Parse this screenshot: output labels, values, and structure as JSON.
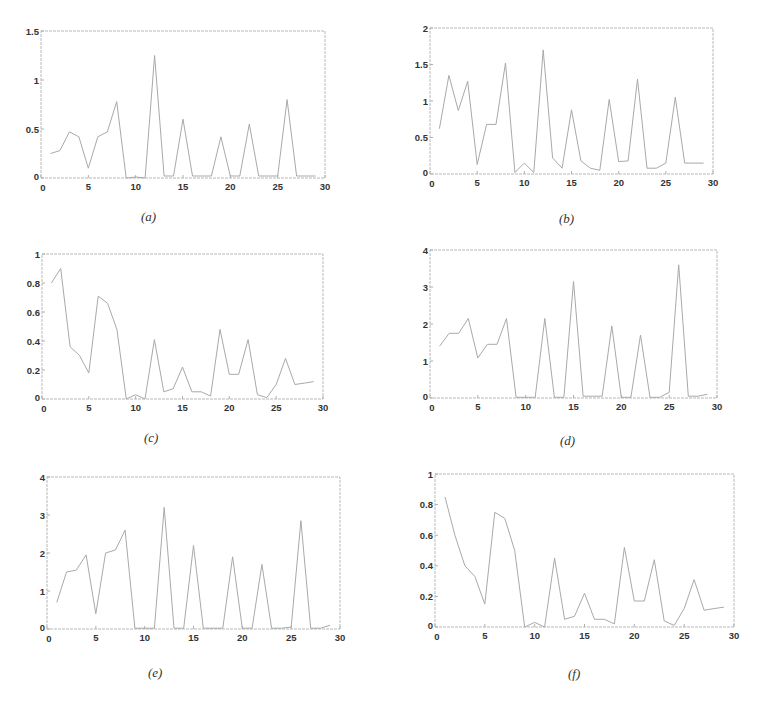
{
  "chart_data": [
    {
      "type": "line",
      "caption": "(a)",
      "x": [
        1,
        2,
        3,
        4,
        5,
        6,
        7,
        8,
        9,
        10,
        11,
        12,
        13,
        14,
        15,
        16,
        17,
        18,
        19,
        20,
        21,
        22,
        23,
        24,
        25,
        26,
        27,
        28,
        29
      ],
      "values": [
        0.25,
        0.28,
        0.47,
        0.42,
        0.1,
        0.42,
        0.47,
        0.78,
        0.0,
        0.01,
        0.0,
        1.25,
        0.02,
        0.02,
        0.6,
        0.02,
        0.02,
        0.02,
        0.42,
        0.02,
        0.02,
        0.55,
        0.02,
        0.02,
        0.02,
        0.8,
        0.02,
        0.02,
        0.02
      ],
      "xlim": [
        0,
        30
      ],
      "ylim": [
        0,
        1.5
      ],
      "xticks": [
        0,
        5,
        10,
        15,
        20,
        25,
        30
      ],
      "yticks": [
        0,
        0.5,
        1,
        1.5
      ],
      "xtick_labels": [
        "0",
        "5",
        "10",
        "15",
        "20",
        "25",
        "30"
      ],
      "ytick_labels": [
        "0",
        "0.5",
        "1",
        "1.5"
      ],
      "title": "",
      "xlabel": "",
      "ylabel": "",
      "grid": false,
      "box": {
        "left": 41,
        "top": 31,
        "right": 325,
        "bottom": 178
      },
      "caption_pos": {
        "left": 141,
        "top": 219
      }
    },
    {
      "type": "line",
      "caption": "(b)",
      "x": [
        1,
        2,
        3,
        4,
        5,
        6,
        7,
        8,
        9,
        10,
        11,
        12,
        13,
        14,
        15,
        16,
        17,
        18,
        19,
        20,
        21,
        22,
        23,
        24,
        25,
        26,
        27,
        28,
        29
      ],
      "values": [
        0.62,
        1.35,
        0.87,
        1.27,
        0.13,
        0.68,
        0.68,
        1.52,
        0.02,
        0.15,
        0.02,
        1.7,
        0.22,
        0.08,
        0.88,
        0.18,
        0.08,
        0.05,
        1.02,
        0.17,
        0.18,
        1.3,
        0.08,
        0.08,
        0.15,
        1.05,
        0.15,
        0.15,
        0.15
      ],
      "xlim": [
        0,
        30
      ],
      "ylim": [
        0,
        2
      ],
      "xticks": [
        0,
        5,
        10,
        15,
        20,
        25,
        30
      ],
      "yticks": [
        0,
        0.5,
        1,
        1.5,
        2
      ],
      "xtick_labels": [
        "0",
        "5",
        "10",
        "15",
        "20",
        "25",
        "30"
      ],
      "ytick_labels": [
        "0",
        "0.5",
        "1",
        "1.5",
        "2"
      ],
      "title": "",
      "xlabel": "",
      "ylabel": "",
      "grid": false,
      "box": {
        "left": 430,
        "top": 28,
        "right": 713,
        "bottom": 174
      },
      "caption_pos": {
        "left": 559,
        "top": 221
      }
    },
    {
      "type": "line",
      "caption": "(c)",
      "x": [
        1,
        2,
        3,
        4,
        5,
        6,
        7,
        8,
        9,
        10,
        11,
        12,
        13,
        14,
        15,
        16,
        17,
        18,
        19,
        20,
        21,
        22,
        23,
        24,
        25,
        26,
        27,
        28,
        29
      ],
      "values": [
        0.8,
        0.9,
        0.36,
        0.3,
        0.18,
        0.71,
        0.66,
        0.48,
        0.0,
        0.03,
        0.0,
        0.41,
        0.05,
        0.07,
        0.22,
        0.05,
        0.05,
        0.02,
        0.48,
        0.17,
        0.17,
        0.41,
        0.03,
        0.01,
        0.1,
        0.28,
        0.1,
        0.11,
        0.12
      ],
      "xlim": [
        0,
        30
      ],
      "ylim": [
        0,
        1
      ],
      "xticks": [
        0,
        5,
        10,
        15,
        20,
        25,
        30
      ],
      "yticks": [
        0,
        0.2,
        0.4,
        0.6,
        0.8,
        1
      ],
      "xtick_labels": [
        "0",
        "5",
        "10",
        "15",
        "20",
        "25",
        "30"
      ],
      "ytick_labels": [
        "0",
        "0.2",
        "0.4",
        "0.6",
        "0.8",
        "1"
      ],
      "title": "",
      "xlabel": "",
      "ylabel": "",
      "grid": false,
      "box": {
        "left": 42,
        "top": 254,
        "right": 323,
        "bottom": 399
      },
      "caption_pos": {
        "left": 144,
        "top": 440
      }
    },
    {
      "type": "line",
      "caption": "(d)",
      "x": [
        1,
        2,
        3,
        4,
        5,
        6,
        7,
        8,
        9,
        10,
        11,
        12,
        13,
        14,
        15,
        16,
        17,
        18,
        19,
        20,
        21,
        22,
        23,
        24,
        25,
        26,
        27,
        28,
        29
      ],
      "values": [
        1.4,
        1.75,
        1.75,
        2.15,
        1.08,
        1.45,
        1.45,
        2.15,
        0.02,
        0.02,
        0.02,
        2.15,
        0.02,
        0.02,
        3.15,
        0.05,
        0.05,
        0.05,
        1.95,
        0.02,
        0.02,
        1.7,
        0.02,
        0.02,
        0.15,
        3.6,
        0.05,
        0.05,
        0.1
      ],
      "xlim": [
        0,
        30
      ],
      "ylim": [
        0,
        4
      ],
      "xticks": [
        0,
        5,
        10,
        15,
        20,
        25,
        30
      ],
      "yticks": [
        0,
        1,
        2,
        3,
        4
      ],
      "xtick_labels": [
        "0",
        "5",
        "10",
        "15",
        "20",
        "25",
        "30"
      ],
      "ytick_labels": [
        "0",
        "1",
        "2",
        "3",
        "4"
      ],
      "title": "",
      "xlabel": "",
      "ylabel": "",
      "grid": false,
      "box": {
        "left": 430,
        "top": 250,
        "right": 717,
        "bottom": 398
      },
      "caption_pos": {
        "left": 560,
        "top": 443
      }
    },
    {
      "type": "line",
      "caption": "(e)",
      "x": [
        1,
        2,
        3,
        4,
        5,
        6,
        7,
        8,
        9,
        10,
        11,
        12,
        13,
        14,
        15,
        16,
        17,
        18,
        19,
        20,
        21,
        22,
        23,
        24,
        25,
        26,
        27,
        28,
        29
      ],
      "values": [
        0.7,
        1.5,
        1.55,
        1.95,
        0.4,
        2.0,
        2.08,
        2.6,
        0.02,
        0.02,
        0.02,
        3.2,
        0.02,
        0.02,
        2.2,
        0.02,
        0.02,
        0.02,
        1.9,
        0.02,
        0.02,
        1.7,
        0.02,
        0.02,
        0.05,
        2.85,
        0.02,
        0.02,
        0.1
      ],
      "xlim": [
        0,
        30
      ],
      "ylim": [
        0,
        4
      ],
      "xticks": [
        0,
        5,
        10,
        15,
        20,
        25,
        30
      ],
      "yticks": [
        0,
        1,
        2,
        3,
        4
      ],
      "xtick_labels": [
        "0",
        "5",
        "10",
        "15",
        "20",
        "25",
        "30"
      ],
      "ytick_labels": [
        "0",
        "1",
        "2",
        "3",
        "4"
      ],
      "title": "",
      "xlabel": "",
      "ylabel": "",
      "grid": false,
      "box": {
        "left": 47,
        "top": 477,
        "right": 340,
        "bottom": 629
      },
      "caption_pos": {
        "left": 148,
        "top": 675
      }
    },
    {
      "type": "line",
      "caption": "(f)",
      "x": [
        1,
        2,
        3,
        4,
        5,
        6,
        7,
        8,
        9,
        10,
        11,
        12,
        13,
        14,
        15,
        16,
        17,
        18,
        19,
        20,
        21,
        22,
        23,
        24,
        25,
        26,
        27,
        28,
        29
      ],
      "values": [
        0.85,
        0.6,
        0.4,
        0.33,
        0.15,
        0.75,
        0.71,
        0.5,
        0.0,
        0.03,
        0.0,
        0.45,
        0.05,
        0.07,
        0.22,
        0.05,
        0.05,
        0.02,
        0.52,
        0.17,
        0.17,
        0.44,
        0.04,
        0.01,
        0.12,
        0.31,
        0.11,
        0.12,
        0.13
      ],
      "xlim": [
        0,
        30
      ],
      "ylim": [
        0,
        1
      ],
      "xticks": [
        0,
        5,
        10,
        15,
        20,
        25,
        30
      ],
      "yticks": [
        0,
        0.2,
        0.4,
        0.6,
        0.8,
        1
      ],
      "xtick_labels": [
        "0",
        "5",
        "10",
        "15",
        "20",
        "25",
        "30"
      ],
      "ytick_labels": [
        "0",
        "0.2",
        "0.4",
        "0.6",
        "0.8",
        "1"
      ],
      "title": "",
      "xlabel": "",
      "ylabel": "",
      "grid": false,
      "box": {
        "left": 435,
        "top": 474,
        "right": 734,
        "bottom": 627
      },
      "caption_pos": {
        "left": 568,
        "top": 676
      }
    }
  ],
  "style": {
    "line_color": "#a9a9a9",
    "axis_color": "#b8b8b8",
    "label_color": "#333333",
    "background": "#ffffff"
  }
}
